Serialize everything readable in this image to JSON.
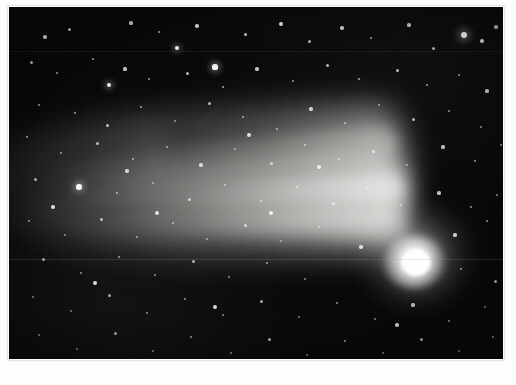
{
  "image": {
    "subject": "comet",
    "caption": "Astronomical photograph of a bright comet with an extended dust tail against a dense star field",
    "alt_text": "Comet with bright nucleus at right and a broad fan-shaped dust tail sweeping toward the upper left across a dense field of stars",
    "orientation": "landscape",
    "media_type": "photographic print",
    "border_style": "white photographic border"
  },
  "canvas": {
    "width_px": 516,
    "height_px": 385,
    "plate_left_px": 9,
    "plate_top_px": 7,
    "plate_width_px": 494,
    "plate_height_px": 352,
    "border_color": "#fdfdfd",
    "sky_color": "#050505",
    "star_color": "#ffffff",
    "comet_color": "#ffffff",
    "tail_color": "#c8c8c4"
  },
  "features": {
    "nucleus": {
      "label": "comet-nucleus",
      "center_x_px": 407,
      "center_y_px": 255,
      "core_radius_px": 14,
      "brightness": "saturated white"
    },
    "coma": {
      "label": "comet-coma",
      "center_x_px": 405,
      "center_y_px": 248,
      "radius_x_px": 63,
      "radius_y_px": 56
    },
    "tail": {
      "label": "dust-tail",
      "direction": "toward upper-left",
      "angle_deg": -3,
      "length_px": 400,
      "max_width_px": 150,
      "streamer_count": 3
    },
    "artifacts": [
      {
        "label": "horizontal-scratch",
        "y_px": 252
      },
      {
        "label": "horizontal-scratch-faint",
        "y_px": 44
      }
    ]
  },
  "stars": [
    {
      "x": 455,
      "y": 28,
      "r": 3.4,
      "o": 1.0
    },
    {
      "x": 473,
      "y": 34,
      "r": 2.1,
      "o": 0.9
    },
    {
      "x": 206,
      "y": 60,
      "r": 2.6,
      "o": 0.95
    },
    {
      "x": 168,
      "y": 41,
      "r": 2.3,
      "o": 0.92
    },
    {
      "x": 100,
      "y": 78,
      "r": 2.4,
      "o": 0.92
    },
    {
      "x": 70,
      "y": 180,
      "r": 2.7,
      "o": 0.96
    },
    {
      "x": 36,
      "y": 30,
      "r": 1.8,
      "o": 0.82
    },
    {
      "x": 60,
      "y": 22,
      "r": 1.5,
      "o": 0.7
    },
    {
      "x": 122,
      "y": 16,
      "r": 1.6,
      "o": 0.72
    },
    {
      "x": 150,
      "y": 25,
      "r": 1.4,
      "o": 0.66
    },
    {
      "x": 188,
      "y": 19,
      "r": 1.7,
      "o": 0.78
    },
    {
      "x": 236,
      "y": 27,
      "r": 1.5,
      "o": 0.7
    },
    {
      "x": 272,
      "y": 17,
      "r": 1.9,
      "o": 0.84
    },
    {
      "x": 300,
      "y": 34,
      "r": 1.5,
      "o": 0.68
    },
    {
      "x": 333,
      "y": 21,
      "r": 1.7,
      "o": 0.76
    },
    {
      "x": 362,
      "y": 31,
      "r": 1.4,
      "o": 0.64
    },
    {
      "x": 400,
      "y": 18,
      "r": 1.6,
      "o": 0.74
    },
    {
      "x": 424,
      "y": 41,
      "r": 1.5,
      "o": 0.7
    },
    {
      "x": 487,
      "y": 20,
      "r": 1.6,
      "o": 0.76
    },
    {
      "x": 496,
      "y": 56,
      "r": 1.4,
      "o": 0.66
    },
    {
      "x": 22,
      "y": 55,
      "r": 1.5,
      "o": 0.68
    },
    {
      "x": 48,
      "y": 66,
      "r": 1.3,
      "o": 0.6
    },
    {
      "x": 84,
      "y": 52,
      "r": 1.4,
      "o": 0.64
    },
    {
      "x": 116,
      "y": 62,
      "r": 1.6,
      "o": 0.74
    },
    {
      "x": 140,
      "y": 72,
      "r": 1.3,
      "o": 0.6
    },
    {
      "x": 178,
      "y": 66,
      "r": 1.5,
      "o": 0.7
    },
    {
      "x": 214,
      "y": 80,
      "r": 1.4,
      "o": 0.64
    },
    {
      "x": 248,
      "y": 62,
      "r": 1.6,
      "o": 0.74
    },
    {
      "x": 284,
      "y": 74,
      "r": 1.3,
      "o": 0.58
    },
    {
      "x": 318,
      "y": 58,
      "r": 1.5,
      "o": 0.7
    },
    {
      "x": 350,
      "y": 72,
      "r": 1.4,
      "o": 0.64
    },
    {
      "x": 388,
      "y": 63,
      "r": 1.5,
      "o": 0.7
    },
    {
      "x": 418,
      "y": 78,
      "r": 1.3,
      "o": 0.58
    },
    {
      "x": 450,
      "y": 68,
      "r": 1.4,
      "o": 0.64
    },
    {
      "x": 478,
      "y": 84,
      "r": 1.6,
      "o": 0.76
    },
    {
      "x": 30,
      "y": 98,
      "r": 1.4,
      "o": 0.62
    },
    {
      "x": 66,
      "y": 106,
      "r": 1.3,
      "o": 0.58
    },
    {
      "x": 98,
      "y": 118,
      "r": 1.5,
      "o": 0.7
    },
    {
      "x": 132,
      "y": 100,
      "r": 1.4,
      "o": 0.62
    },
    {
      "x": 166,
      "y": 114,
      "r": 1.3,
      "o": 0.56
    },
    {
      "x": 200,
      "y": 96,
      "r": 1.5,
      "o": 0.68
    },
    {
      "x": 234,
      "y": 110,
      "r": 1.4,
      "o": 0.62
    },
    {
      "x": 268,
      "y": 122,
      "r": 1.3,
      "o": 0.56
    },
    {
      "x": 302,
      "y": 102,
      "r": 1.6,
      "o": 0.74
    },
    {
      "x": 336,
      "y": 116,
      "r": 1.4,
      "o": 0.62
    },
    {
      "x": 370,
      "y": 98,
      "r": 1.3,
      "o": 0.56
    },
    {
      "x": 404,
      "y": 112,
      "r": 1.5,
      "o": 0.68
    },
    {
      "x": 440,
      "y": 104,
      "r": 1.4,
      "o": 0.62
    },
    {
      "x": 472,
      "y": 120,
      "r": 1.3,
      "o": 0.58
    },
    {
      "x": 18,
      "y": 130,
      "r": 1.4,
      "o": 0.62
    },
    {
      "x": 52,
      "y": 146,
      "r": 1.3,
      "o": 0.56
    },
    {
      "x": 88,
      "y": 136,
      "r": 1.5,
      "o": 0.68
    },
    {
      "x": 124,
      "y": 152,
      "r": 1.4,
      "o": 0.6
    },
    {
      "x": 158,
      "y": 140,
      "r": 1.3,
      "o": 0.56
    },
    {
      "x": 192,
      "y": 158,
      "r": 1.6,
      "o": 0.72
    },
    {
      "x": 226,
      "y": 142,
      "r": 1.3,
      "o": 0.56
    },
    {
      "x": 262,
      "y": 156,
      "r": 1.5,
      "o": 0.66
    },
    {
      "x": 296,
      "y": 138,
      "r": 1.4,
      "o": 0.6
    },
    {
      "x": 330,
      "y": 152,
      "r": 1.3,
      "o": 0.54
    },
    {
      "x": 364,
      "y": 144,
      "r": 1.5,
      "o": 0.66
    },
    {
      "x": 398,
      "y": 158,
      "r": 1.3,
      "o": 0.54
    },
    {
      "x": 434,
      "y": 140,
      "r": 1.6,
      "o": 0.72
    },
    {
      "x": 466,
      "y": 154,
      "r": 1.4,
      "o": 0.6
    },
    {
      "x": 492,
      "y": 138,
      "r": 1.3,
      "o": 0.56
    },
    {
      "x": 26,
      "y": 172,
      "r": 1.5,
      "o": 0.66
    },
    {
      "x": 108,
      "y": 186,
      "r": 1.4,
      "o": 0.6
    },
    {
      "x": 144,
      "y": 176,
      "r": 1.3,
      "o": 0.54
    },
    {
      "x": 180,
      "y": 192,
      "r": 1.5,
      "o": 0.66
    },
    {
      "x": 216,
      "y": 178,
      "r": 1.3,
      "o": 0.54
    },
    {
      "x": 252,
      "y": 194,
      "r": 1.4,
      "o": 0.6
    },
    {
      "x": 288,
      "y": 180,
      "r": 1.3,
      "o": 0.54
    },
    {
      "x": 324,
      "y": 196,
      "r": 1.5,
      "o": 0.66
    },
    {
      "x": 358,
      "y": 182,
      "r": 1.3,
      "o": 0.52
    },
    {
      "x": 392,
      "y": 198,
      "r": 1.4,
      "o": 0.58
    },
    {
      "x": 430,
      "y": 186,
      "r": 1.6,
      "o": 0.74
    },
    {
      "x": 462,
      "y": 200,
      "r": 1.4,
      "o": 0.6
    },
    {
      "x": 488,
      "y": 188,
      "r": 1.3,
      "o": 0.56
    },
    {
      "x": 20,
      "y": 214,
      "r": 1.4,
      "o": 0.6
    },
    {
      "x": 56,
      "y": 228,
      "r": 1.3,
      "o": 0.54
    },
    {
      "x": 92,
      "y": 212,
      "r": 1.5,
      "o": 0.66
    },
    {
      "x": 128,
      "y": 230,
      "r": 1.3,
      "o": 0.54
    },
    {
      "x": 164,
      "y": 216,
      "r": 1.4,
      "o": 0.58
    },
    {
      "x": 198,
      "y": 232,
      "r": 1.3,
      "o": 0.52
    },
    {
      "x": 236,
      "y": 218,
      "r": 1.5,
      "o": 0.64
    },
    {
      "x": 272,
      "y": 234,
      "r": 1.3,
      "o": 0.52
    },
    {
      "x": 310,
      "y": 220,
      "r": 1.4,
      "o": 0.58
    },
    {
      "x": 446,
      "y": 228,
      "r": 1.6,
      "o": 0.74
    },
    {
      "x": 478,
      "y": 214,
      "r": 1.4,
      "o": 0.6
    },
    {
      "x": 500,
      "y": 236,
      "r": 1.3,
      "o": 0.56
    },
    {
      "x": 34,
      "y": 252,
      "r": 1.5,
      "o": 0.64
    },
    {
      "x": 72,
      "y": 266,
      "r": 1.3,
      "o": 0.54
    },
    {
      "x": 110,
      "y": 250,
      "r": 1.4,
      "o": 0.58
    },
    {
      "x": 146,
      "y": 268,
      "r": 1.3,
      "o": 0.52
    },
    {
      "x": 184,
      "y": 254,
      "r": 1.5,
      "o": 0.64
    },
    {
      "x": 220,
      "y": 270,
      "r": 1.3,
      "o": 0.52
    },
    {
      "x": 258,
      "y": 256,
      "r": 1.4,
      "o": 0.58
    },
    {
      "x": 296,
      "y": 272,
      "r": 1.3,
      "o": 0.52
    },
    {
      "x": 452,
      "y": 262,
      "r": 1.4,
      "o": 0.6
    },
    {
      "x": 486,
      "y": 274,
      "r": 1.5,
      "o": 0.66
    },
    {
      "x": 24,
      "y": 290,
      "r": 1.4,
      "o": 0.58
    },
    {
      "x": 62,
      "y": 304,
      "r": 1.3,
      "o": 0.52
    },
    {
      "x": 100,
      "y": 288,
      "r": 1.5,
      "o": 0.64
    },
    {
      "x": 138,
      "y": 306,
      "r": 1.3,
      "o": 0.52
    },
    {
      "x": 176,
      "y": 292,
      "r": 1.4,
      "o": 0.58
    },
    {
      "x": 214,
      "y": 308,
      "r": 1.3,
      "o": 0.5
    },
    {
      "x": 252,
      "y": 294,
      "r": 1.5,
      "o": 0.64
    },
    {
      "x": 290,
      "y": 310,
      "r": 1.3,
      "o": 0.5
    },
    {
      "x": 328,
      "y": 296,
      "r": 1.4,
      "o": 0.58
    },
    {
      "x": 366,
      "y": 312,
      "r": 1.3,
      "o": 0.5
    },
    {
      "x": 404,
      "y": 298,
      "r": 1.6,
      "o": 0.72
    },
    {
      "x": 440,
      "y": 314,
      "r": 1.4,
      "o": 0.58
    },
    {
      "x": 476,
      "y": 300,
      "r": 1.3,
      "o": 0.52
    },
    {
      "x": 30,
      "y": 328,
      "r": 1.4,
      "o": 0.58
    },
    {
      "x": 68,
      "y": 342,
      "r": 1.3,
      "o": 0.5
    },
    {
      "x": 106,
      "y": 326,
      "r": 1.5,
      "o": 0.64
    },
    {
      "x": 144,
      "y": 344,
      "r": 1.3,
      "o": 0.5
    },
    {
      "x": 182,
      "y": 330,
      "r": 1.4,
      "o": 0.56
    },
    {
      "x": 222,
      "y": 346,
      "r": 1.3,
      "o": 0.5
    },
    {
      "x": 260,
      "y": 332,
      "r": 1.5,
      "o": 0.62
    },
    {
      "x": 298,
      "y": 348,
      "r": 1.3,
      "o": 0.48
    },
    {
      "x": 336,
      "y": 334,
      "r": 1.4,
      "o": 0.56
    },
    {
      "x": 374,
      "y": 346,
      "r": 1.3,
      "o": 0.48
    },
    {
      "x": 412,
      "y": 332,
      "r": 1.5,
      "o": 0.62
    },
    {
      "x": 450,
      "y": 344,
      "r": 1.3,
      "o": 0.48
    },
    {
      "x": 484,
      "y": 330,
      "r": 1.4,
      "o": 0.56
    },
    {
      "x": 44,
      "y": 200,
      "r": 2.0,
      "o": 0.86
    },
    {
      "x": 240,
      "y": 128,
      "r": 1.9,
      "o": 0.82
    },
    {
      "x": 352,
      "y": 240,
      "r": 1.8,
      "o": 0.8
    },
    {
      "x": 310,
      "y": 160,
      "r": 1.8,
      "o": 0.78
    },
    {
      "x": 148,
      "y": 206,
      "r": 1.9,
      "o": 0.82
    },
    {
      "x": 86,
      "y": 276,
      "r": 2.0,
      "o": 0.86
    },
    {
      "x": 206,
      "y": 300,
      "r": 1.9,
      "o": 0.82
    },
    {
      "x": 388,
      "y": 318,
      "r": 1.8,
      "o": 0.78
    },
    {
      "x": 262,
      "y": 206,
      "r": 1.8,
      "o": 0.78
    },
    {
      "x": 118,
      "y": 164,
      "r": 1.8,
      "o": 0.76
    }
  ]
}
